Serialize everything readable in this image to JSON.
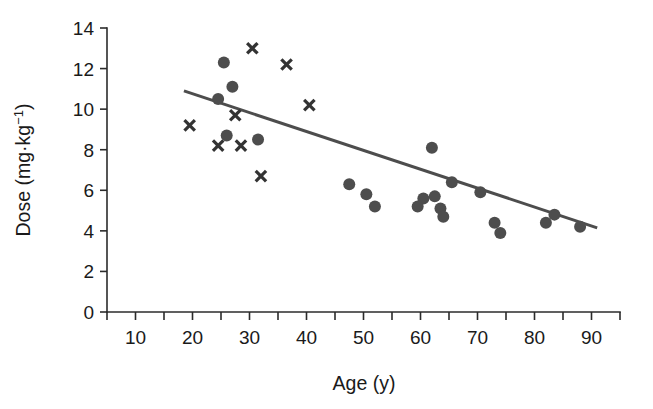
{
  "chart_data": {
    "type": "scatter",
    "title": "",
    "xlabel": "Age (y)",
    "ylabel": "Dose (mg·kg−1)",
    "ylabel_base": "Dose (mg·kg",
    "ylabel_exponent": "−1",
    "ylabel_close": ")",
    "xlim": [
      5,
      95
    ],
    "ylim": [
      0,
      14
    ],
    "xticks": [
      10,
      20,
      30,
      40,
      50,
      60,
      70,
      80,
      90
    ],
    "xtick_labels": [
      "10",
      "20",
      "30",
      "40",
      "50",
      "60",
      "70",
      "80",
      "90"
    ],
    "xminor_step": 5,
    "yticks": [
      0,
      2,
      4,
      6,
      8,
      10,
      12,
      14
    ],
    "ytick_labels": [
      "0",
      "2",
      "4",
      "6",
      "8",
      "10",
      "12",
      "14"
    ],
    "grid": false,
    "legend": null,
    "marker_colors": {
      "circle": "#4d4d4d",
      "cross": "#333333",
      "fit_line": "#4d4d4d",
      "axis": "#2b2b2b"
    },
    "series": [
      {
        "name": "circle-series",
        "marker": "circle",
        "points": [
          {
            "x": 25.5,
            "y": 12.3
          },
          {
            "x": 27.0,
            "y": 11.1
          },
          {
            "x": 24.5,
            "y": 10.5
          },
          {
            "x": 26.0,
            "y": 8.7
          },
          {
            "x": 31.5,
            "y": 8.5
          },
          {
            "x": 62.0,
            "y": 8.1
          },
          {
            "x": 47.5,
            "y": 6.3
          },
          {
            "x": 65.5,
            "y": 6.4
          },
          {
            "x": 50.5,
            "y": 5.8
          },
          {
            "x": 52.0,
            "y": 5.2
          },
          {
            "x": 60.5,
            "y": 5.6
          },
          {
            "x": 59.5,
            "y": 5.2
          },
          {
            "x": 62.5,
            "y": 5.7
          },
          {
            "x": 63.5,
            "y": 5.1
          },
          {
            "x": 64.0,
            "y": 4.7
          },
          {
            "x": 70.5,
            "y": 5.9
          },
          {
            "x": 73.0,
            "y": 4.4
          },
          {
            "x": 74.0,
            "y": 3.9
          },
          {
            "x": 82.0,
            "y": 4.4
          },
          {
            "x": 83.5,
            "y": 4.8
          },
          {
            "x": 88.0,
            "y": 4.2
          }
        ]
      },
      {
        "name": "cross-series",
        "marker": "cross",
        "points": [
          {
            "x": 30.5,
            "y": 13.0
          },
          {
            "x": 36.5,
            "y": 12.2
          },
          {
            "x": 40.5,
            "y": 10.2
          },
          {
            "x": 27.5,
            "y": 9.7
          },
          {
            "x": 19.5,
            "y": 9.2
          },
          {
            "x": 24.5,
            "y": 8.2
          },
          {
            "x": 28.5,
            "y": 8.2
          },
          {
            "x": 32.0,
            "y": 6.7
          }
        ]
      }
    ],
    "fit_line": {
      "name": "regression-line",
      "x_start": 18.5,
      "y_start": 10.9,
      "x_end": 91.0,
      "y_end": 4.15
    }
  }
}
